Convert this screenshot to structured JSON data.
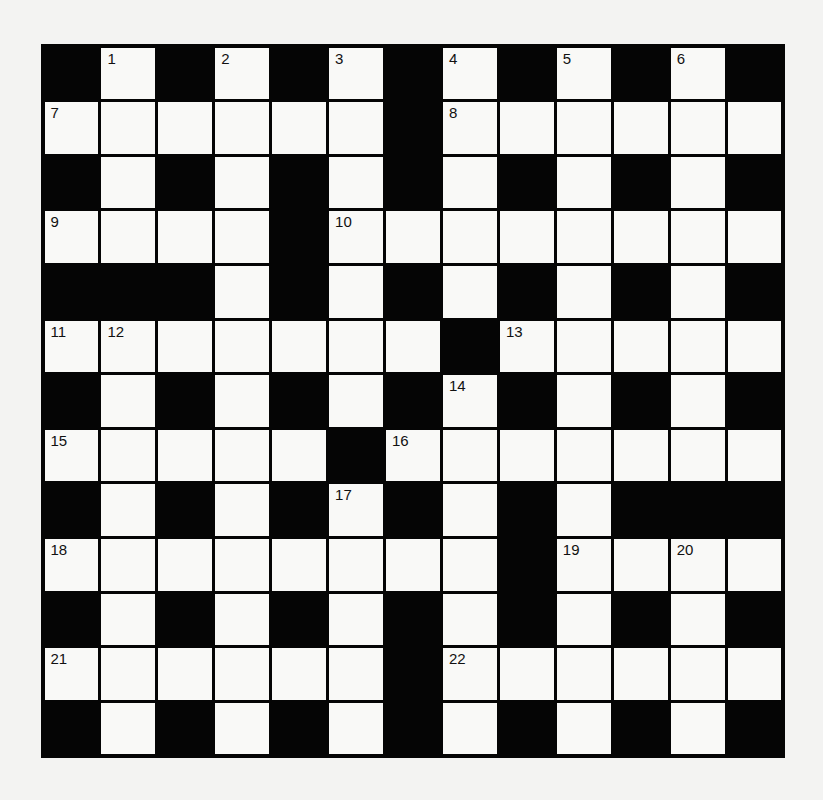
{
  "puzzle": {
    "rows": 13,
    "cols": 13,
    "colors": {
      "block": "#050505",
      "cell": "#f9f9f7",
      "background": "#f3f3f2"
    },
    "grid": [
      "#.#.#.#.#.#.#",
      "......#......",
      "#.#.#.#.#.#.#",
      "....#........",
      "###.#.#.#.#.#",
      ".......#.....",
      "#.#.#.#.#.#.#",
      ".....#.......",
      "#.#.#.#.#.###",
      "........#....",
      "#.#.#.#.#.#.#",
      "......#......",
      "#.#.#.#.#.#.#"
    ],
    "numbers": [
      {
        "row": 0,
        "col": 1,
        "label": "1"
      },
      {
        "row": 0,
        "col": 3,
        "label": "2"
      },
      {
        "row": 0,
        "col": 5,
        "label": "3"
      },
      {
        "row": 0,
        "col": 7,
        "label": "4"
      },
      {
        "row": 0,
        "col": 9,
        "label": "5"
      },
      {
        "row": 0,
        "col": 11,
        "label": "6"
      },
      {
        "row": 1,
        "col": 0,
        "label": "7"
      },
      {
        "row": 1,
        "col": 7,
        "label": "8"
      },
      {
        "row": 3,
        "col": 0,
        "label": "9"
      },
      {
        "row": 3,
        "col": 5,
        "label": "10"
      },
      {
        "row": 5,
        "col": 0,
        "label": "11"
      },
      {
        "row": 5,
        "col": 1,
        "label": "12"
      },
      {
        "row": 5,
        "col": 8,
        "label": "13"
      },
      {
        "row": 6,
        "col": 7,
        "label": "14"
      },
      {
        "row": 7,
        "col": 0,
        "label": "15"
      },
      {
        "row": 7,
        "col": 6,
        "label": "16"
      },
      {
        "row": 8,
        "col": 5,
        "label": "17"
      },
      {
        "row": 9,
        "col": 0,
        "label": "18"
      },
      {
        "row": 9,
        "col": 9,
        "label": "19"
      },
      {
        "row": 9,
        "col": 11,
        "label": "20"
      },
      {
        "row": 11,
        "col": 0,
        "label": "21"
      },
      {
        "row": 11,
        "col": 7,
        "label": "22"
      }
    ]
  }
}
